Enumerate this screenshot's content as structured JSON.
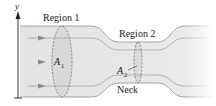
{
  "diagram": {
    "axis": {
      "label": "y"
    },
    "labels": {
      "region1": "Region 1",
      "region2": "Region 2",
      "area1_main": "A",
      "area1_sub": "1",
      "area2_main": "A",
      "area2_sub": "2",
      "neck": "Neck"
    },
    "colors": {
      "pipe_fill": "#e6e7e8",
      "pipe_fill_light": "#f1f2f2",
      "pipe_edge": "#8c8f93",
      "streamline": "#9a9da1",
      "arrow": "#8a8d91",
      "ellipse": "#5f6266",
      "axis": "#222222",
      "text": "#222222"
    }
  }
}
